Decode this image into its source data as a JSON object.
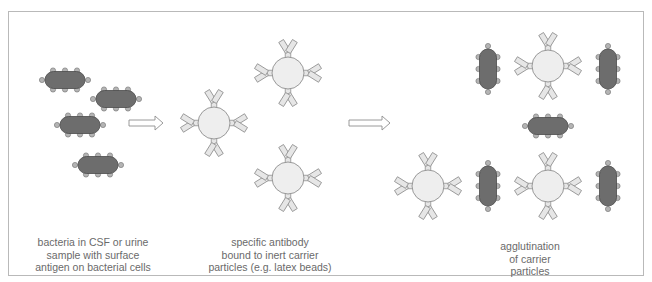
{
  "figure": {
    "panels": [
      {
        "id": "left",
        "caption_lines": [
          "bacteria in CSF or urine",
          "sample with surface",
          "antigen on bacterial cells"
        ]
      },
      {
        "id": "middle",
        "caption_lines": [
          "specific antibody",
          "bound to inert carrier",
          "particles (e.g. latex beads)"
        ]
      },
      {
        "id": "right",
        "caption_lines": [
          "agglutination",
          "of carrier",
          "particles"
        ]
      }
    ],
    "colors": {
      "frame": "#b9b9b9",
      "bacterium_fill": "#6d6d6d",
      "bacterium_stroke": "#4a4a4a",
      "antigen_fill": "#b4b4b4",
      "antigen_stroke": "#7d7d7d",
      "bead_fill": "#eeeeee",
      "bead_stroke": "#8f8f8f",
      "antibody_fill": "#e6e6e6",
      "antibody_stroke": "#8f8f8f",
      "arrow_stroke": "#8f8f8f",
      "caption": "#6a6a6a"
    },
    "elements": {
      "bacteria": [
        {
          "x": 65,
          "y": 80,
          "orient": "h"
        },
        {
          "x": 116,
          "y": 99,
          "orient": "h"
        },
        {
          "x": 80,
          "y": 125,
          "orient": "h"
        },
        {
          "x": 98,
          "y": 165,
          "orient": "h"
        },
        {
          "x": 488,
          "y": 69,
          "orient": "v"
        },
        {
          "x": 608,
          "y": 69,
          "orient": "v"
        },
        {
          "x": 548,
          "y": 126,
          "orient": "h"
        },
        {
          "x": 488,
          "y": 186,
          "orient": "v"
        },
        {
          "x": 608,
          "y": 186,
          "orient": "v"
        }
      ],
      "arrows": [
        {
          "x1": 129,
          "x2": 163,
          "y": 123
        },
        {
          "x1": 349,
          "x2": 390,
          "y": 123
        }
      ],
      "beads": [
        {
          "x": 214,
          "y": 123,
          "arms": [
            "up",
            "down",
            "left",
            "right"
          ]
        },
        {
          "x": 288,
          "y": 73,
          "arms": [
            "up",
            "down",
            "left",
            "right"
          ]
        },
        {
          "x": 288,
          "y": 178,
          "arms": [
            "up",
            "down",
            "left",
            "right"
          ]
        },
        {
          "x": 548,
          "y": 66,
          "arms": [
            "up",
            "down",
            "left",
            "right"
          ]
        },
        {
          "x": 428,
          "y": 186,
          "arms": [
            "up",
            "down",
            "left",
            "right"
          ]
        },
        {
          "x": 548,
          "y": 186,
          "arms": [
            "up",
            "down",
            "left",
            "right"
          ]
        }
      ]
    }
  }
}
